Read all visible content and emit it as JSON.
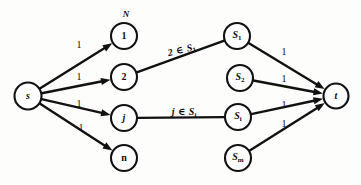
{
  "figure": {
    "kind": "flow-network-diagram",
    "caption_label": "N",
    "colors": {
      "ink": "#111111",
      "background": "#fdfdfc",
      "node_fill": "#ffffff"
    }
  },
  "nodes": [
    {
      "id": "s",
      "label": "s",
      "sub": "",
      "cx": 28,
      "cy": 96,
      "r": 13.5,
      "italic": true
    },
    {
      "id": "n1",
      "label": "1",
      "sub": "",
      "cx": 124,
      "cy": 36,
      "r": 13.0,
      "italic": false
    },
    {
      "id": "n2",
      "label": "2",
      "sub": "",
      "cx": 124,
      "cy": 77,
      "r": 13.0,
      "italic": false
    },
    {
      "id": "nj",
      "label": "j",
      "sub": "",
      "cx": 124,
      "cy": 118,
      "r": 13.0,
      "italic": true
    },
    {
      "id": "nn",
      "label": "n",
      "sub": "",
      "cx": 124,
      "cy": 158,
      "r": 13.0,
      "italic": false
    },
    {
      "id": "s1",
      "label": "S",
      "sub": "1",
      "cx": 237,
      "cy": 36,
      "r": 13.0,
      "italic": true
    },
    {
      "id": "s2",
      "label": "S",
      "sub": "2",
      "cx": 240,
      "cy": 78,
      "r": 13.0,
      "italic": true
    },
    {
      "id": "si",
      "label": "S",
      "sub": "i",
      "cx": 238,
      "cy": 117,
      "r": 13.0,
      "italic": true
    },
    {
      "id": "sm",
      "label": "S",
      "sub": "m",
      "cx": 238,
      "cy": 158,
      "r": 13.0,
      "italic": true
    },
    {
      "id": "t",
      "label": "t",
      "sub": "",
      "cx": 336,
      "cy": 96,
      "r": 12.5,
      "italic": true
    }
  ],
  "edges": [
    {
      "id": "s-1",
      "from": "s",
      "to": "n1",
      "arrow": true,
      "weight": "1"
    },
    {
      "id": "s-2",
      "from": "s",
      "to": "n2",
      "arrow": true,
      "weight": "1"
    },
    {
      "id": "s-j",
      "from": "s",
      "to": "nj",
      "arrow": true,
      "weight": "1"
    },
    {
      "id": "s-n",
      "from": "s",
      "to": "nn",
      "arrow": true,
      "weight": "1"
    },
    {
      "id": "2-S1",
      "from": "n2",
      "to": "s1",
      "arrow": false,
      "weight": ""
    },
    {
      "id": "j-Si",
      "from": "nj",
      "to": "si",
      "arrow": false,
      "weight": ""
    },
    {
      "id": "S1-t",
      "from": "s1",
      "to": "t",
      "arrow": true,
      "weight": "1"
    },
    {
      "id": "S2-t",
      "from": "s2",
      "to": "t",
      "arrow": true,
      "weight": "1"
    },
    {
      "id": "Si-t",
      "from": "si",
      "to": "t",
      "arrow": true,
      "weight": "1"
    },
    {
      "id": "Sm-t",
      "from": "sm",
      "to": "t",
      "arrow": true,
      "weight": "1"
    }
  ],
  "weight_labels": [
    {
      "id": "w-s-1",
      "text": "1",
      "x": 79,
      "y": 45
    },
    {
      "id": "w-s-2",
      "text": "1",
      "x": 79,
      "y": 77
    },
    {
      "id": "w-s-j",
      "text": "1",
      "x": 79,
      "y": 104
    },
    {
      "id": "w-s-n",
      "text": "1",
      "x": 81,
      "y": 128
    },
    {
      "id": "w-S1-t",
      "text": "1",
      "x": 284,
      "y": 52
    },
    {
      "id": "w-S2-t",
      "text": "1",
      "x": 284,
      "y": 79
    },
    {
      "id": "w-Si-t",
      "text": "1",
      "x": 284,
      "y": 105
    },
    {
      "id": "w-Sm-t",
      "text": "1",
      "x": 284,
      "y": 124
    }
  ],
  "set_labels": [
    {
      "id": "set-2-S1",
      "elem": "2",
      "op": "∈",
      "set": "S",
      "sub": "1",
      "x": 182,
      "y": 51,
      "rotate": -13
    },
    {
      "id": "set-j-Si",
      "elem": "j",
      "op": "∈",
      "set": "S",
      "sub": "i",
      "x": 184,
      "y": 113,
      "rotate": 0
    }
  ],
  "corner_labels": [
    {
      "id": "network-label",
      "text": "N",
      "x": 126,
      "y": 14
    }
  ]
}
